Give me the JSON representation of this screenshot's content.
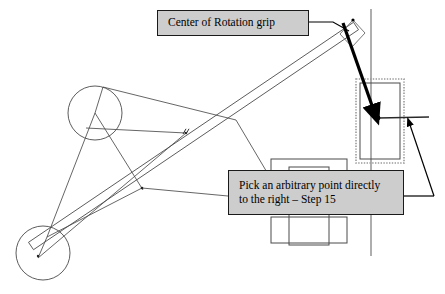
{
  "page": {
    "background_color": "#ffffff",
    "width": 445,
    "height": 294
  },
  "callouts": [
    {
      "id": "center-of-rotation",
      "text": "Center of Rotation grip",
      "fill": "#cdcdcd",
      "border": "#1a1a1a",
      "x": 157,
      "y": 10,
      "w": 152,
      "h": 26
    },
    {
      "id": "arbitrary-point",
      "text": "Pick an arbitrary point directly\nto the right – Step 15",
      "fill": "#cdcdcd",
      "border": "#1a1a1a",
      "x": 228,
      "y": 170,
      "w": 176,
      "h": 45
    }
  ],
  "colors": {
    "line": "#4a4a4a",
    "line_dark": "#000000",
    "guide": "#8c8c8c",
    "dotted": "#9a9a9a",
    "callout_fill": "#cdcdcd",
    "callout_border": "#1a1a1a"
  },
  "geometry": {
    "circles": [
      {
        "name": "upper-pivot-circle",
        "cx": 95,
        "cy": 113,
        "r": 27
      },
      {
        "name": "lower-pivot-circle",
        "cx": 43,
        "cy": 253,
        "r": 27
      }
    ],
    "vertical_guide": {
      "x": 371,
      "y1": 9,
      "y2": 256
    },
    "long_bar": {
      "name": "rotating-bar",
      "p1x": 31,
      "p1y": 246,
      "p2x": 356,
      "p2y": 26,
      "thickness": 9
    },
    "bar_end_marker": {
      "cx": 353,
      "cy": 20,
      "r": 1.6
    },
    "thin_links": [
      {
        "name": "link-upper-left",
        "x1": 95,
        "y1": 113,
        "x2": 103,
        "y2": 87
      },
      {
        "name": "link-upper-right",
        "x1": 103,
        "y1": 87,
        "x2": 236,
        "y2": 120
      },
      {
        "name": "link-upper-lower",
        "x1": 95,
        "y1": 113,
        "x2": 47,
        "y2": 237
      },
      {
        "name": "link-lower-brace",
        "x1": 47,
        "y1": 237,
        "x2": 38,
        "y2": 258
      },
      {
        "name": "link-lower-diagonal",
        "x1": 47,
        "y1": 237,
        "x2": 142,
        "y2": 188
      },
      {
        "name": "link-callout-leader-left",
        "x1": 142,
        "y1": 188,
        "x2": 228,
        "y2": 196
      },
      {
        "name": "link-mid-horizontal",
        "x1": 86,
        "y1": 128,
        "x2": 186,
        "y2": 133
      },
      {
        "name": "link-truss-right",
        "x1": 236,
        "y1": 120,
        "x2": 268,
        "y2": 174
      },
      {
        "name": "link-lower-chord",
        "x1": 38,
        "y1": 258,
        "x2": 186,
        "y2": 133
      },
      {
        "name": "link-pivot-cross",
        "x1": 95,
        "y1": 113,
        "x2": 143,
        "y2": 190
      }
    ],
    "point_markers": [
      {
        "name": "mid-tick-point",
        "cx": 186,
        "cy": 133,
        "r": 1.2
      },
      {
        "name": "lower-node-point",
        "cx": 142,
        "cy": 188,
        "r": 1.3
      },
      {
        "name": "lower-center-point",
        "cx": 38,
        "cy": 256,
        "r": 1.2
      }
    ],
    "tick_mark": {
      "x": 183,
      "y": 128,
      "len": 6,
      "angle": -60
    },
    "slider_block": {
      "name": "slider-block",
      "x": 289,
      "y": 167,
      "w": 40,
      "h": 78
    },
    "slider_rails": [
      {
        "name": "slider-rail-top",
        "x": 271,
        "y": 159,
        "w": 76,
        "h": 14
      },
      {
        "name": "slider-rail-bottom",
        "x": 271,
        "y": 217,
        "w": 76,
        "h": 26
      }
    ],
    "dotted_rect": {
      "name": "selection-marquee",
      "x": 356,
      "y": 79,
      "w": 48,
      "h": 84
    },
    "inner_rect": {
      "name": "target-rectangle",
      "x": 360,
      "y": 83,
      "w": 40,
      "h": 76
    },
    "target_dot": {
      "name": "arbitrary-point-dot",
      "cx": 378,
      "cy": 118,
      "r": 2.4
    },
    "target_line": {
      "name": "point-horizontal-line",
      "x1": 378,
      "y1": 118,
      "x2": 429,
      "y2": 117
    },
    "thick_arrow": {
      "name": "grip-pointer-arrow",
      "x1": 343,
      "y1": 23,
      "x2": 375,
      "y2": 114,
      "width": 3.2
    },
    "thin_arrow": {
      "name": "point-pointer-arrow",
      "x1": 434,
      "y1": 196,
      "x2": 409,
      "y2": 122,
      "width": 1.2
    },
    "leader_rotation": {
      "name": "rotation-callout-leader",
      "points": "309,22 333,22 349,31"
    },
    "leader_arbitrary": {
      "name": "arbitrary-callout-leader",
      "points": "404,196 434,196"
    },
    "grip_box": {
      "name": "grip-handle-box",
      "points": "340,34 353,20 365,33 352,47"
    }
  }
}
